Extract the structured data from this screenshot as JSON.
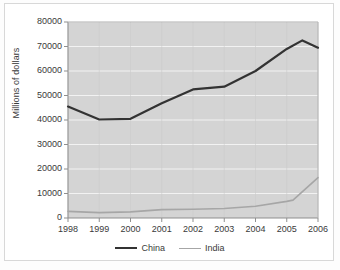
{
  "chart_data": {
    "type": "line",
    "title": "",
    "xlabel": "",
    "ylabel": "Millions of dollars",
    "x": [
      1998,
      1999,
      2000,
      2001,
      2002,
      2003,
      2004,
      2005,
      2006
    ],
    "categories": [
      "1998",
      "1999",
      "2000",
      "2001",
      "2002",
      "2003",
      "2004",
      "2005",
      "2006"
    ],
    "xlim": [
      1998,
      2006
    ],
    "ylim": [
      0,
      80000
    ],
    "ytick_step": 10000,
    "yticks": [
      0,
      10000,
      20000,
      30000,
      40000,
      50000,
      60000,
      70000,
      80000
    ],
    "ytick_labels": [
      "0",
      "10000",
      "20000",
      "30000",
      "40000",
      "50000",
      "60000",
      "70000",
      "80000"
    ],
    "grid": true,
    "grid_orientation": "horizontal",
    "legend_position": "bottom",
    "plot_background": "#d4d4d4",
    "gridline_color": "#f2f2f2",
    "series": [
      {
        "name": "China",
        "color": "#333333",
        "width": 2.2,
        "values": [
          45500,
          40200,
          40500,
          46800,
          52500,
          53600,
          60000,
          69000,
          69500
        ],
        "peak": {
          "x": 2005.5,
          "y": 72500
        }
      },
      {
        "name": "India",
        "color": "#a6a6a6",
        "width": 1.6,
        "values": [
          2700,
          2200,
          2500,
          3400,
          3600,
          3900,
          4800,
          6800,
          16500
        ],
        "inflection": {
          "x": 2005.2,
          "y": 7300
        }
      }
    ]
  },
  "legend": {
    "items": [
      {
        "label": "China",
        "color": "#333333",
        "width": "2.2px"
      },
      {
        "label": "India",
        "color": "#a6a6a6",
        "width": "1.6px"
      }
    ]
  },
  "axis": {
    "y_title": "Millions of dollars"
  }
}
